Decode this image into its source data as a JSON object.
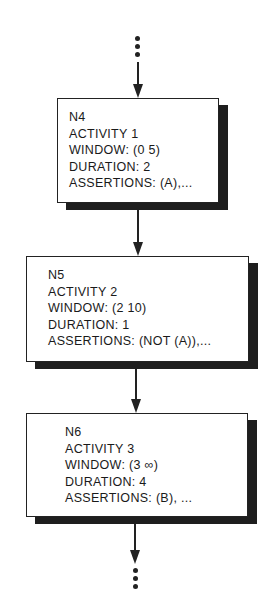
{
  "diagram": {
    "type": "flowchart",
    "continuation_top": "...",
    "continuation_bottom": "...",
    "nodes": [
      {
        "id": "N4",
        "activity": "ACTIVITY 1",
        "window": "WINDOW: (0 5)",
        "duration": "DURATION: 2",
        "assertions": "ASSERTIONS: (A),..."
      },
      {
        "id": "N5",
        "activity": "ACTIVITY 2",
        "window": "WINDOW: (2 10)",
        "duration": "DURATION:  1",
        "assertions": "ASSERTIONS: (NOT (A)),..."
      },
      {
        "id": "N6",
        "activity": "ACTIVITY 3",
        "window": "WINDOW: (3 ∞)",
        "duration": "DURATION:  4",
        "assertions": "ASSERTIONS:  (B), ..."
      }
    ],
    "edges": [
      {
        "from": "...",
        "to": "N4"
      },
      {
        "from": "N4",
        "to": "N5"
      },
      {
        "from": "N5",
        "to": "N6"
      },
      {
        "from": "N6",
        "to": "..."
      }
    ]
  }
}
